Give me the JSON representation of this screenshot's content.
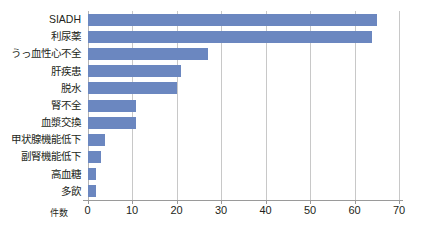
{
  "chart_data": {
    "type": "bar",
    "orientation": "horizontal",
    "title": "",
    "xlabel": "件数",
    "ylabel": "",
    "xlim": [
      0,
      70
    ],
    "xticks": [
      0,
      10,
      20,
      30,
      40,
      50,
      60,
      70
    ],
    "grid": "vertical",
    "legend": "none",
    "bar_color": "#6b87c0",
    "gridline_color": "#c8c8c8",
    "axis_color": "#9a9a9a",
    "text_color": "#231f20",
    "categories": [
      "SIADH",
      "利尿薬",
      "うっ血性心不全",
      "肝疾患",
      "脱水",
      "腎不全",
      "血漿交換",
      "甲状腺機能低下",
      "副腎機能低下",
      "高血糖",
      "多飲"
    ],
    "values": [
      65,
      64,
      27,
      21,
      20,
      11,
      11,
      4,
      3,
      2,
      2
    ]
  }
}
